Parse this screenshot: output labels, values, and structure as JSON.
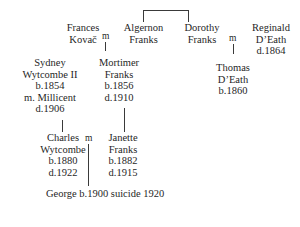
{
  "diagram": {
    "line_color": "#3a3a3a",
    "text_color": "#1f1f1f",
    "background": "#ffffff"
  },
  "people": {
    "frances_kovac": {
      "line1": "Frances",
      "line2": "Kovač"
    },
    "algernon_franks": {
      "line1": "Algernon",
      "line2": "Franks"
    },
    "dorothy_franks": {
      "line1": "Dorothy",
      "line2": "Franks"
    },
    "reginald_death": {
      "line1": "Reginald",
      "line2": "D’Eath",
      "line3": "d.1864"
    },
    "sydney_wytcombe": {
      "line1": "Sydney",
      "line2": "Wytcombe II",
      "line3": "b.1854",
      "line4": "m. Millicent",
      "line5": "d.1906"
    },
    "mortimer_franks": {
      "line1": "Mortimer",
      "line2": "Franks",
      "line3": "b.1856",
      "line4": "d.1910"
    },
    "thomas_death": {
      "line1": "Thomas",
      "line2": "D’Eath",
      "line3": "b.1860"
    },
    "charles_wytcombe": {
      "line1": "Charles",
      "line2": "Wytcombe",
      "line3": "b.1880",
      "line4": "d.1922"
    },
    "janette_franks": {
      "line1": "Janette",
      "line2": "Franks",
      "line3": "b.1882",
      "line4": "d.1915"
    },
    "george": {
      "line1": "George b.1900",
      "line2": "suicide 1920"
    }
  },
  "marriages": {
    "frances_mortimer_symbol": "m",
    "dorothy_reginald_symbol": "m",
    "charles_janette_symbol": "m"
  }
}
